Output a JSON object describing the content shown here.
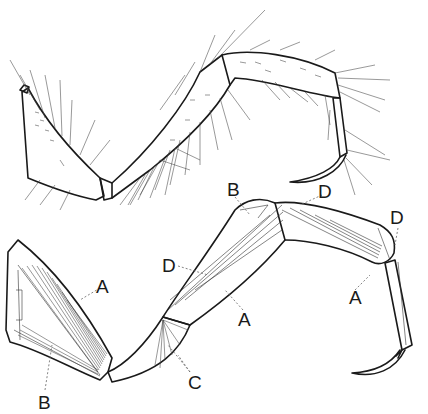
{
  "figure": {
    "upper_drawing": "external view of leg with setae",
    "lower_drawing": "internal view showing muscles",
    "labels": [
      {
        "id": "lbl-a-coxa",
        "text": "A",
        "x": 96,
        "y": 277
      },
      {
        "id": "lbl-b-coxa",
        "text": "B",
        "x": 38,
        "y": 393
      },
      {
        "id": "lbl-c-trochanter",
        "text": "C",
        "x": 188,
        "y": 375
      },
      {
        "id": "lbl-d-femur",
        "text": "D",
        "x": 162,
        "y": 256
      },
      {
        "id": "lbl-a-femur",
        "text": "A",
        "x": 238,
        "y": 311
      },
      {
        "id": "lbl-b-femur",
        "text": "B",
        "x": 227,
        "y": 181
      },
      {
        "id": "lbl-d-tibia-top",
        "text": "D",
        "x": 318,
        "y": 183
      },
      {
        "id": "lbl-d-tibia-end",
        "text": "D",
        "x": 390,
        "y": 210
      },
      {
        "id": "lbl-a-tibia",
        "text": "A",
        "x": 349,
        "y": 290
      }
    ],
    "colors": {
      "line": "#1a1a1a",
      "background": "#ffffff",
      "leader": "#666666"
    }
  }
}
